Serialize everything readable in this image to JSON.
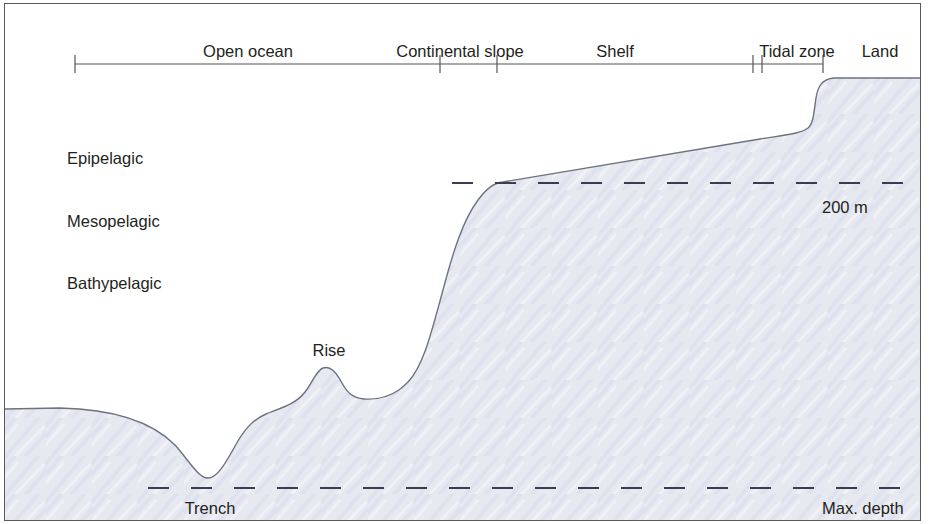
{
  "figure": {
    "background_color": "#ffffff",
    "frame_color": "#5a5a5a",
    "fill_color": "#e7e9f1",
    "outline_color": "#6b7280",
    "dash_color": "#3b3b52",
    "text_color": "#231f20"
  },
  "scale_bar": {
    "axis_y": 64,
    "start_x": 75,
    "end_x": 823,
    "tick_positions": [
      75,
      440,
      497,
      753,
      762,
      823
    ],
    "zones": [
      {
        "label": "Open ocean",
        "center_x": 248,
        "label_y": 43
      },
      {
        "label": "Continental slope",
        "center_x": 460,
        "label_y": 43
      },
      {
        "label": "Shelf",
        "center_x": 615,
        "label_y": 43
      },
      {
        "label": "Tidal zone",
        "center_x": 797,
        "label_y": 43
      },
      {
        "label": "Land",
        "center_x": 880,
        "label_y": 43
      }
    ]
  },
  "pelagic_zones": [
    {
      "label": "Epipelagic",
      "y": 150
    },
    {
      "label": "Mesopelagic",
      "y": 213
    },
    {
      "label": "Bathypelagic",
      "y": 275
    }
  ],
  "depth_lines": [
    {
      "name": "200 m",
      "label": "200 m",
      "y": 183,
      "label_x": 822,
      "label_y": 199,
      "start_x": 452,
      "end_x": 921
    },
    {
      "name": "Max. depth",
      "label": "Max. depth",
      "y": 488,
      "label_x": 822,
      "label_y": 500,
      "start_x": 148,
      "end_x": 921
    }
  ],
  "features": [
    {
      "label": "Rise",
      "center_x": 329,
      "label_y": 342
    },
    {
      "label": "Trench",
      "center_x": 210,
      "label_y": 500
    }
  ],
  "profile": {
    "description": "Seafloor and land surface from deep ocean through trench, rise, continental slope, shelf, tidal zone to land",
    "path": "M 5 409 L 60 408 C 110 409 150 420 175 445 C 190 462 198 477 207 478 C 216 479 224 466 234 448 C 243 431 252 420 266 414 C 281 408 296 404 305 392 C 312 383 316 371 323 368 C 331 365 337 374 342 383 C 347 392 352 398 364 399 C 378 400 395 396 408 382 C 424 365 432 330 443 290 C 453 252 463 220 478 200 C 487 188 494 183 503 182 L 760 139 C 785 135 800 134 808 128 C 814 123 814 110 816 98 C 818 86 822 79 834 78 L 921 78"
  }
}
